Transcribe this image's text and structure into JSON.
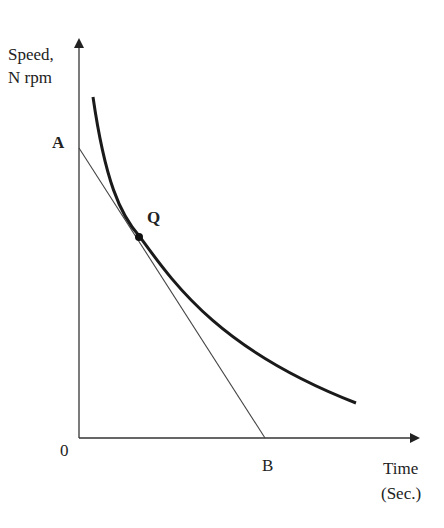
{
  "diagram": {
    "y_axis_label_line1": "Speed,",
    "y_axis_label_line2": "N rpm",
    "x_axis_label_line1": "Time",
    "x_axis_label_line2": "(Sec.)",
    "origin_label": "0",
    "point_a_label": "A",
    "point_b_label": "B",
    "point_q_label": "Q",
    "curve_description": "Speed-time decay curve with tangent AB at point Q",
    "colors": {
      "ink": "#222222",
      "background": "#ffffff"
    }
  }
}
